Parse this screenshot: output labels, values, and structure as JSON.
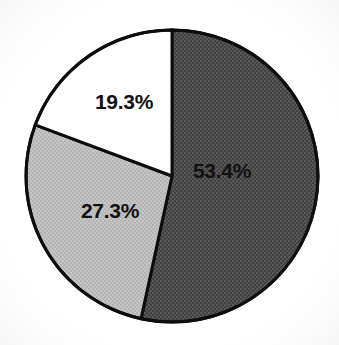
{
  "chart_data": {
    "type": "pie",
    "title": "",
    "subtitle": "",
    "xlabel": "",
    "ylabel": "",
    "grid": false,
    "legend": "none",
    "start_angle_deg": 0,
    "direction": "clockwise",
    "categories": [
      "Segment 1",
      "Segment 2",
      "Segment 3"
    ],
    "values": [
      53.4,
      27.3,
      19.3
    ],
    "labels": [
      "53.4%",
      "27.3%",
      "19.3%"
    ],
    "slices": [
      {
        "label": "53.4%",
        "value": 53.4,
        "fill_style": "dark-gray-dither",
        "color": "#4a4a4a",
        "start_deg": 0.0,
        "end_deg": 192.24,
        "label_x": 222,
        "label_y": 172
      },
      {
        "label": "27.3%",
        "value": 27.3,
        "fill_style": "light-gray-dither",
        "color": "#bdbdbd",
        "start_deg": 192.24,
        "end_deg": 290.52,
        "label_x": 110,
        "label_y": 212
      },
      {
        "label": "19.3%",
        "value": 19.3,
        "fill_style": "white",
        "color": "#ffffff",
        "start_deg": 290.52,
        "end_deg": 360.0,
        "label_x": 124,
        "label_y": 103
      }
    ],
    "total": 100.0,
    "geometry": {
      "center_x": 172,
      "center_y": 176,
      "radius": 146,
      "outline_color": "#0d0d0d",
      "outline_width": 3
    },
    "background": "#ffffff"
  }
}
